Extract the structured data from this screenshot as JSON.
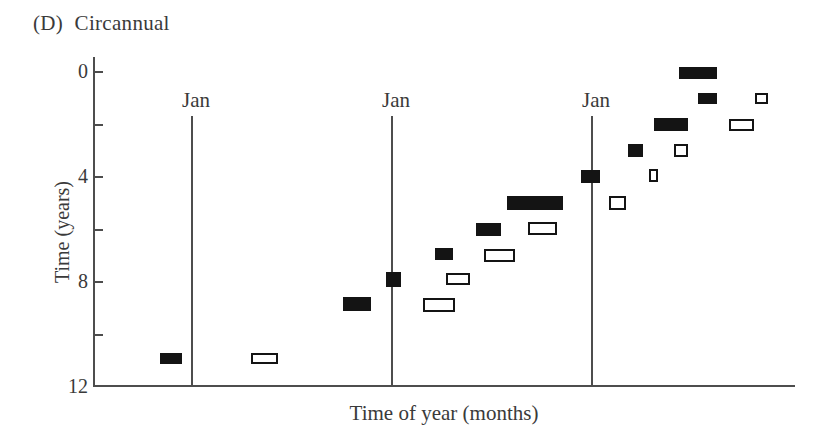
{
  "title": "(D) Circannual",
  "colors": {
    "background": "#ffffff",
    "bar_fill": "#141414",
    "bar_open_fill": "#ffffff",
    "bar_open_border": "#141414",
    "axis_line": "#4d4d4d",
    "text": "#3a3a3a"
  },
  "chart_data": {
    "type": "bar",
    "subtype": "actogram-event-plot",
    "title": "(D) Circannual",
    "xlabel": "Time of year (months)",
    "ylabel": "Time (years)",
    "grid": false,
    "legend": "none",
    "x_axis": {
      "unit": "months (0 = first January line)",
      "jan_label": "Jan",
      "jan_lines_months": [
        0,
        12,
        24
      ],
      "visible_range_months": [
        -5.9,
        36.2
      ]
    },
    "y_axis": {
      "unit": "years",
      "range": [
        0,
        12
      ],
      "direction": "downward (0 at top)",
      "tick_years": [
        0,
        2,
        4,
        6,
        8,
        10
      ],
      "labeled_ticks": [
        {
          "year": 0,
          "label": "0"
        },
        {
          "year": 4,
          "label": "4"
        },
        {
          "year": 8,
          "label": "8"
        },
        {
          "year": 12,
          "label": "12"
        }
      ]
    },
    "series": [
      {
        "name": "filled-event-bars",
        "style": "filled",
        "color": "#141414",
        "events": [
          {
            "months": [
              29.2,
              31.5
            ],
            "year": 0.05,
            "h": 12
          },
          {
            "months": [
              30.35,
              31.5
            ],
            "year": 1.0,
            "h": 11
          },
          {
            "months": [
              27.7,
              29.75
            ],
            "year": 2.0,
            "h": 13
          },
          {
            "months": [
              26.15,
              27.05
            ],
            "year": 3.0,
            "h": 13
          },
          {
            "months": [
              23.35,
              24.5
            ],
            "year": 3.98,
            "h": 13
          },
          {
            "months": [
              18.9,
              22.25
            ],
            "year": 5.0,
            "h": 14
          },
          {
            "months": [
              17.05,
              18.55
            ],
            "year": 6.0,
            "h": 13
          },
          {
            "months": [
              14.6,
              15.65
            ],
            "year": 6.95,
            "h": 12
          },
          {
            "months": [
              11.65,
              12.55
            ],
            "year": 7.9,
            "h": 15
          },
          {
            "months": [
              9.05,
              10.75
            ],
            "year": 8.85,
            "h": 14
          },
          {
            "months": [
              -1.95,
              -0.6
            ],
            "year": 10.9,
            "h": 11
          }
        ]
      },
      {
        "name": "open-event-bars",
        "style": "open",
        "color": "#ffffff",
        "border": "#141414",
        "events": [
          {
            "months": [
              33.8,
              34.55
            ],
            "year": 1.0,
            "h": 11
          },
          {
            "months": [
              32.2,
              33.75
            ],
            "year": 2.0,
            "h": 12
          },
          {
            "months": [
              28.9,
              29.75
            ],
            "year": 2.97,
            "h": 13
          },
          {
            "months": [
              27.4,
              27.95
            ],
            "year": 3.95,
            "h": 13
          },
          {
            "months": [
              25.0,
              26.05
            ],
            "year": 4.97,
            "h": 14
          },
          {
            "months": [
              20.15,
              21.9
            ],
            "year": 5.95,
            "h": 13
          },
          {
            "months": [
              17.5,
              19.4
            ],
            "year": 6.97,
            "h": 13
          },
          {
            "months": [
              15.25,
              16.7
            ],
            "year": 7.88,
            "h": 12
          },
          {
            "months": [
              13.85,
              15.8
            ],
            "year": 8.87,
            "h": 14
          },
          {
            "months": [
              3.55,
              5.15
            ],
            "year": 10.9,
            "h": 11
          }
        ]
      }
    ],
    "pixel_mapping": {
      "x0_px": 192,
      "px_per_month": 16.667,
      "y0_px": 72,
      "px_per_year": 26.25,
      "yaxis_x_px": 93,
      "yaxis_top_px": 57,
      "xaxis_y_px": 385,
      "xaxis_right_px": 795,
      "jan_line_top_px": 116,
      "jan_label_top_px": 88
    }
  }
}
